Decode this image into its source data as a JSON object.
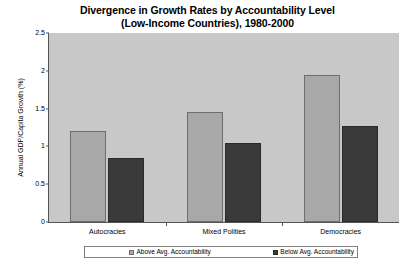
{
  "chart_data": {
    "type": "bar",
    "title": "Divergence in Growth Rates by Accountability Level (Low-Income Countries), 1980-2000",
    "title_lines": [
      "Divergence in Growth Rates by Accountability Level",
      "(Low-Income Countries), 1980-2000"
    ],
    "xlabel": "",
    "ylabel": "Annual GDP/Capita Growth (%)",
    "ylim": [
      0,
      2.5
    ],
    "ytick_labels": [
      "0",
      "0.5",
      "1",
      "1.5",
      "2",
      "2.5"
    ],
    "ytick_values": [
      0,
      0.5,
      1,
      1.5,
      2,
      2.5
    ],
    "grid": false,
    "legend_position": "bottom",
    "categories": [
      "Autocracies",
      "Mixed Polities",
      "Democracies"
    ],
    "series": [
      {
        "name": "Above Avg. Accountability",
        "color": "#a8a8a8",
        "values": [
          1.2,
          1.45,
          1.95
        ]
      },
      {
        "name": "Below Avg. Accountability",
        "color": "#3a3a3a",
        "values": [
          0.85,
          1.04,
          1.27
        ]
      }
    ],
    "plot_background": "#c8c8c8",
    "figure_background": "#ffffff",
    "axis_color": "#555555"
  }
}
